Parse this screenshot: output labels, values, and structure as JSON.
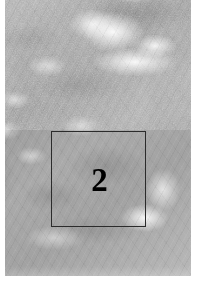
{
  "figure": {
    "kind": "grayscale-tissue-scan",
    "canvas": {
      "width": 199,
      "height": 292
    },
    "background_color": "#ffffff"
  },
  "scan": {
    "name": "tissue-scan-image",
    "x": 5,
    "y": 0,
    "width": 186,
    "height": 276,
    "base_color": "#a9a9a9",
    "highlight_color": "#ffffff",
    "shadow_color": "#5f5f5f"
  },
  "annotation": {
    "roi": {
      "label": "2",
      "x": 51,
      "y": 131,
      "width": 95,
      "height": 96,
      "stroke_color": "#2b2b2b",
      "stroke_width": 1,
      "label_color": "#000000",
      "label_font_size": 33
    }
  }
}
